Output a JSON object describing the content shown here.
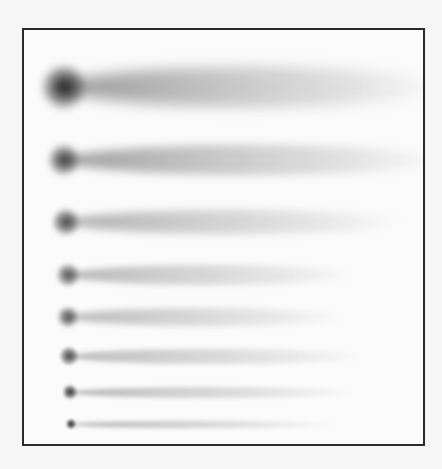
{
  "figure": {
    "frame": {
      "left": 22,
      "top": 28,
      "right": 424,
      "bottom": 444,
      "border_color": "#2a2a2a"
    },
    "streaks": [
      {
        "y": 57,
        "head_x": 40,
        "head_size": 42,
        "tail_len": 380,
        "tail_h": 40,
        "darkness": 0.95,
        "tail_opacity": 0.45
      },
      {
        "y": 130,
        "head_x": 40,
        "head_size": 30,
        "tail_len": 380,
        "tail_h": 30,
        "darkness": 0.8,
        "tail_opacity": 0.42
      },
      {
        "y": 192,
        "head_x": 42,
        "head_size": 26,
        "tail_len": 340,
        "tail_h": 24,
        "darkness": 0.75,
        "tail_opacity": 0.35
      },
      {
        "y": 245,
        "head_x": 44,
        "head_size": 22,
        "tail_len": 290,
        "tail_h": 20,
        "darkness": 0.7,
        "tail_opacity": 0.32
      },
      {
        "y": 287,
        "head_x": 44,
        "head_size": 20,
        "tail_len": 280,
        "tail_h": 18,
        "darkness": 0.72,
        "tail_opacity": 0.3
      },
      {
        "y": 326,
        "head_x": 45,
        "head_size": 18,
        "tail_len": 300,
        "tail_h": 15,
        "darkness": 0.75,
        "tail_opacity": 0.3
      },
      {
        "y": 362,
        "head_x": 46,
        "head_size": 14,
        "tail_len": 290,
        "tail_h": 11,
        "darkness": 0.85,
        "tail_opacity": 0.32
      },
      {
        "y": 394,
        "head_x": 47,
        "head_size": 10,
        "tail_len": 270,
        "tail_h": 7,
        "darkness": 0.9,
        "tail_opacity": 0.35
      }
    ]
  }
}
